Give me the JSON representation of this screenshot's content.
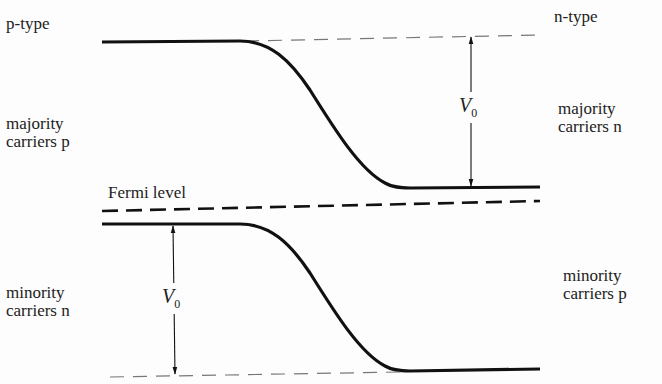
{
  "diagram": {
    "left_region": {
      "type_label": "p-type",
      "upper_label": [
        "majority",
        "carriers p"
      ],
      "lower_label": [
        "minority",
        "carriers n"
      ]
    },
    "right_region": {
      "type_label": "n-type",
      "upper_label": [
        "majority",
        "carriers n"
      ],
      "lower_label": [
        "minority",
        "carriers p"
      ]
    },
    "fermi_label": "Fermi level",
    "barrier_symbol": "V",
    "barrier_subscript": "0",
    "colors": {
      "line": "#111111",
      "dashed_reference": "#777777",
      "text": "#222222",
      "background": "#fdfdfd"
    }
  }
}
